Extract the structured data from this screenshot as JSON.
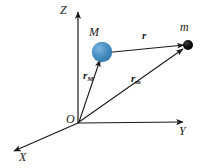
{
  "figure": {
    "background_color": "#ffffff",
    "line_color": "#1a1a1a",
    "sphere_color": "#4a90c4",
    "sphere_edge_color": "#2f78ad",
    "point_color": "#000000"
  },
  "axes": {
    "z": {
      "label": "Z",
      "from": [
        78,
        123
      ],
      "to": [
        78,
        10
      ]
    },
    "y": {
      "label": "Y",
      "from": [
        78,
        123
      ],
      "to": [
        185,
        122
      ]
    },
    "x": {
      "label": "X",
      "from": [
        78,
        123
      ],
      "to": [
        12,
        152
      ]
    }
  },
  "origin": {
    "label": "O",
    "x": 78,
    "y": 123
  },
  "bodies": [
    {
      "name": "M",
      "label": "M",
      "type": "sphere",
      "x": 102,
      "y": 52,
      "radius": 10,
      "color": "#4a90c4"
    },
    {
      "name": "m",
      "label": "m",
      "type": "point",
      "x": 188,
      "y": 45,
      "radius": 5,
      "color": "#000000"
    }
  ],
  "vectors": [
    {
      "name": "r",
      "label": "r",
      "subscript": "",
      "from": [
        102,
        53
      ],
      "to": [
        186,
        44
      ],
      "label_pos": [
        142,
        30
      ]
    },
    {
      "name": "r_M",
      "label": "r",
      "subscript": "M",
      "from": [
        78,
        123
      ],
      "to": [
        100,
        58
      ],
      "label_pos": [
        83,
        70
      ]
    },
    {
      "name": "r_m",
      "label": "r",
      "subscript": "m",
      "from": [
        78,
        123
      ],
      "to": [
        184,
        48
      ],
      "label_pos": [
        131,
        73
      ]
    }
  ]
}
